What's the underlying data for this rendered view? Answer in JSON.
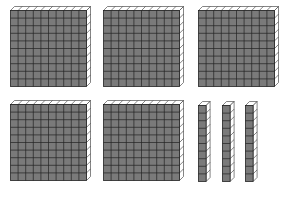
{
  "diagram": {
    "representation": {
      "hundreds": 5,
      "tens": 3,
      "ones": 0,
      "value": 530
    },
    "colors": {
      "face": "#7a7a7a",
      "grid": "#222222",
      "side": "#ffffff",
      "outline": "#333333"
    },
    "flats": [
      {
        "id": "flat-1",
        "x": 10,
        "y": 6
      },
      {
        "id": "flat-2",
        "x": 103,
        "y": 6
      },
      {
        "id": "flat-3",
        "x": 198,
        "y": 6
      },
      {
        "id": "flat-4",
        "x": 10,
        "y": 100
      },
      {
        "id": "flat-5",
        "x": 103,
        "y": 100
      }
    ],
    "rods": [
      {
        "id": "rod-1",
        "x": 198,
        "y": 101
      },
      {
        "id": "rod-2",
        "x": 222,
        "y": 101
      },
      {
        "id": "rod-3",
        "x": 245,
        "y": 101
      }
    ]
  }
}
